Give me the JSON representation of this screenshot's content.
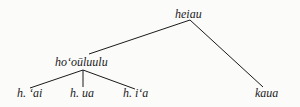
{
  "tree": {
    "root": {
      "label": "heiau"
    },
    "children": [
      {
        "label": "hoʻoūluulu",
        "children": [
          {
            "label": "h. ʻai"
          },
          {
            "label": "h. ua"
          },
          {
            "label": "h. iʻa"
          }
        ]
      },
      {
        "label": "kaua"
      }
    ]
  },
  "colors": {
    "line": "#1a1a1a",
    "background": "#fbfbfa"
  }
}
